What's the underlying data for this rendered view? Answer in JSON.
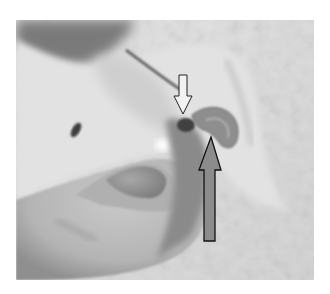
{
  "image": {
    "description": "Grayscale photograph of a pet's paw held between human fingers, showing a claw with the quick; two arrows annotate the claw",
    "palette": {
      "background_floor": "#d9d9d9",
      "fur_light": "#e6e6e6",
      "fur_dark": "#6e6e6e",
      "skin": "#bdbdbd",
      "nail": "#8a8a8a",
      "quick": "#4a4a4a",
      "arrow_small_fill": "#f2f2f2",
      "arrow_large_fill": "#8c8c8c",
      "arrow_outline": "#111111"
    }
  },
  "annotations": [
    {
      "name": "quick-pointer",
      "direction": "down",
      "color": "#f2f2f2"
    },
    {
      "name": "nail-pointer",
      "direction": "up",
      "color": "#8c8c8c"
    }
  ]
}
